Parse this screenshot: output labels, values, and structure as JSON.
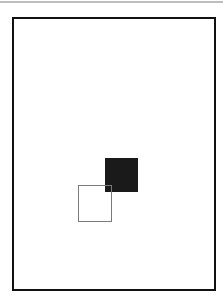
{
  "canvas": {
    "width": 223,
    "height": 301,
    "background": "#ffffff"
  },
  "shapes": [
    {
      "name": "frame",
      "type": "rectangle",
      "fill": "none",
      "stroke": "#111111"
    },
    {
      "name": "filled-square",
      "type": "square",
      "fill": "#1a1a1a"
    },
    {
      "name": "outline-square",
      "type": "square",
      "fill": "none",
      "stroke": "#7a7a7a"
    }
  ]
}
